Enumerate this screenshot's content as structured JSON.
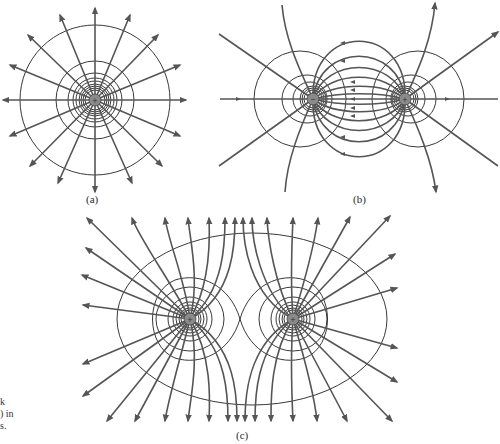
{
  "figures": [
    {
      "id": "a",
      "label": "(a)",
      "description": "Field lines and equipotentials of a single positive point charge",
      "charges": [
        {
          "sign": "+",
          "symbol": "+"
        }
      ]
    },
    {
      "id": "b",
      "label": "(b)",
      "description": "Electric dipole: negative and positive charges with field lines and equipotentials",
      "charges": [
        {
          "sign": "-",
          "symbol": "−"
        },
        {
          "sign": "+",
          "symbol": "+"
        }
      ]
    },
    {
      "id": "c",
      "label": "(c)",
      "description": "Two equal positive charges with field lines and equipotentials",
      "charges": [
        {
          "sign": "+",
          "symbol": "+"
        },
        {
          "sign": "+",
          "symbol": "+"
        }
      ]
    }
  ],
  "caption_fragment": [
    "k",
    ") in",
    "s."
  ],
  "colors": {
    "field_line": "#555555",
    "equipotential": "#222222",
    "charge_fill": "#8a8a8a",
    "background": "#ffffff"
  }
}
